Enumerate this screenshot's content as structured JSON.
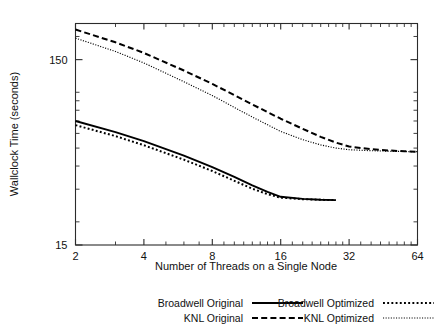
{
  "chart_data": {
    "type": "line",
    "title": "",
    "xlabel": "Number of Threads on a Single Node",
    "ylabel": "Wallclock Time (seconds)",
    "xscale": "log2",
    "yscale": "log",
    "xlim": [
      2,
      64
    ],
    "ylim": [
      15,
      235
    ],
    "grid": false,
    "legend_position": "bottom",
    "x_ticks": [
      2,
      4,
      8,
      16,
      32,
      64
    ],
    "x_tick_labels": [
      "2",
      "4",
      "8",
      "16",
      "32",
      "64"
    ],
    "y_ticks": [
      15,
      150
    ],
    "y_tick_labels": [
      "15",
      "150"
    ],
    "y_minor_ticks": [
      20,
      30,
      40,
      50,
      60,
      70,
      80,
      90,
      100,
      200
    ],
    "series": [
      {
        "name": "Broadwell Original",
        "style": "solid",
        "x": [
          2,
          3,
          4,
          6,
          8,
          10,
          12,
          14,
          16,
          20,
          24,
          28
        ],
        "values": [
          70.0,
          61.0,
          54.5,
          45.5,
          39.5,
          35.0,
          31.5,
          29.0,
          27.3,
          26.6,
          26.3,
          26.2
        ]
      },
      {
        "name": "KNL Original",
        "style": "dashed",
        "x": [
          2,
          3,
          4,
          6,
          8,
          12,
          16,
          20,
          24,
          28,
          32,
          40,
          48,
          56,
          64
        ],
        "values": [
          218.0,
          186.0,
          163.0,
          131.0,
          111.0,
          86.0,
          72.0,
          63.5,
          57.5,
          53.5,
          51.0,
          49.3,
          48.5,
          48.1,
          47.8
        ]
      },
      {
        "name": "Broadwell Optimized",
        "style": "dotted-coarse",
        "x": [
          2,
          3,
          4,
          6,
          8,
          10,
          12,
          14,
          16,
          20,
          24,
          28
        ],
        "values": [
          66.5,
          58.0,
          51.8,
          43.3,
          37.6,
          33.3,
          30.2,
          28.2,
          27.0,
          26.5,
          26.3,
          26.2
        ]
      },
      {
        "name": "KNL Optimized",
        "style": "dotted-fine",
        "x": [
          2,
          3,
          4,
          6,
          8,
          12,
          16,
          20,
          24,
          28,
          32,
          40,
          48,
          56,
          64
        ],
        "values": [
          196.0,
          166.0,
          144.0,
          114.0,
          96.0,
          73.5,
          61.5,
          55.5,
          52.0,
          50.0,
          49.0,
          48.4,
          48.1,
          47.9,
          47.8
        ]
      }
    ]
  },
  "axes": {
    "x_title": "Number of Threads on a Single Node",
    "y_title": "Wallclock Time (seconds)",
    "x_tick_labels": [
      "2",
      "4",
      "8",
      "16",
      "32",
      "64"
    ],
    "y_tick_labels": [
      "150",
      "15"
    ]
  },
  "legend": {
    "entries": [
      {
        "label": "Broadwell Original",
        "style": "solid"
      },
      {
        "label": "Broadwell Optimized",
        "style": "dotted-coarse"
      },
      {
        "label": "KNL Original",
        "style": "dashed"
      },
      {
        "label": "KNL Optimized",
        "style": "dotted-fine"
      }
    ]
  },
  "colors": {
    "line": "#000000",
    "axis": "#2b2b2b",
    "text": "#111111",
    "background": "#ffffff"
  }
}
